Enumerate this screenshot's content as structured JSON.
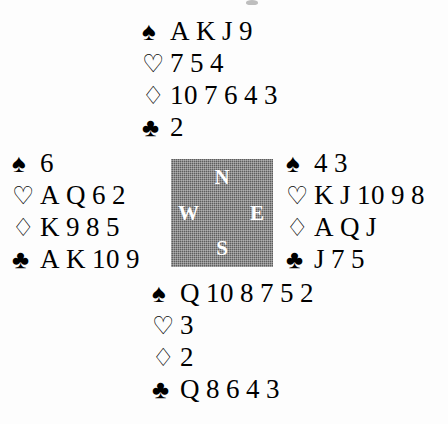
{
  "diagram": {
    "type": "bridge-deal-diagram",
    "suit_symbols": {
      "spades": "♠",
      "hearts": "♡",
      "diamonds": "♢",
      "clubs": "♣"
    },
    "compass": {
      "north": "N",
      "west": "W",
      "east": "E",
      "south": "S",
      "background_color": "#5d5d5d",
      "label_color": "#ffffff"
    },
    "hands": {
      "north": {
        "position_label": "N",
        "spades": [
          "A",
          "K",
          "J",
          "9"
        ],
        "hearts": [
          "7",
          "5",
          "4"
        ],
        "diamonds": [
          "10",
          "7",
          "6",
          "4",
          "3"
        ],
        "clubs": [
          "2"
        ]
      },
      "west": {
        "position_label": "W",
        "spades": [
          "6"
        ],
        "hearts": [
          "A",
          "Q",
          "6",
          "2"
        ],
        "diamonds": [
          "K",
          "9",
          "8",
          "5"
        ],
        "clubs": [
          "A",
          "K",
          "10",
          "9"
        ]
      },
      "east": {
        "position_label": "E",
        "spades": [
          "4",
          "3"
        ],
        "hearts": [
          "K",
          "J",
          "10",
          "9",
          "8"
        ],
        "diamonds": [
          "A",
          "Q",
          "J"
        ],
        "clubs": [
          "J",
          "7",
          "5"
        ]
      },
      "south": {
        "position_label": "S",
        "spades": [
          "Q",
          "10",
          "8",
          "7",
          "5",
          "2"
        ],
        "hearts": [
          "3"
        ],
        "diamonds": [
          "2"
        ],
        "clubs": [
          "Q",
          "8",
          "6",
          "4",
          "3"
        ]
      }
    }
  }
}
